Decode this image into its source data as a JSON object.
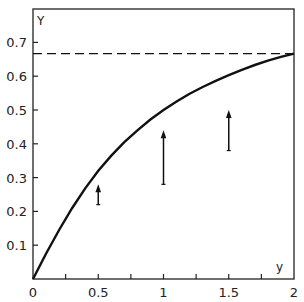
{
  "chart_data": {
    "type": "line",
    "title": "",
    "xlabel": "y",
    "ylabel": "Y",
    "xlim": [
      0,
      2
    ],
    "ylim": [
      0,
      0.78
    ],
    "x_ticks": [
      "0",
      "0.5",
      "1",
      "1.5",
      "2"
    ],
    "x_tick_values": [
      0,
      0.5,
      1,
      1.5,
      2
    ],
    "x_minor_ticks": [
      0.25,
      0.75,
      1.25,
      1.75
    ],
    "y_ticks": [
      "0.1",
      "0.2",
      "0.3",
      "0.4",
      "0.5",
      "0.6",
      "0.7"
    ],
    "y_tick_values": [
      0.1,
      0.2,
      0.3,
      0.4,
      0.5,
      0.6,
      0.7
    ],
    "grid": false,
    "series": [
      {
        "name": "curve",
        "style": "solid",
        "x": [
          0,
          0.1,
          0.2,
          0.3,
          0.4,
          0.5,
          0.6,
          0.7,
          0.8,
          0.9,
          1.0,
          1.1,
          1.2,
          1.3,
          1.4,
          1.5,
          1.6,
          1.7,
          1.8,
          1.9,
          2.0
        ],
        "y": [
          0,
          0.075,
          0.145,
          0.21,
          0.268,
          0.32,
          0.365,
          0.405,
          0.44,
          0.472,
          0.5,
          0.525,
          0.548,
          0.568,
          0.586,
          0.603,
          0.619,
          0.633,
          0.646,
          0.657,
          0.667
        ]
      },
      {
        "name": "asymptote",
        "style": "dashed",
        "x": [
          0,
          2
        ],
        "y": [
          0.667,
          0.667
        ]
      }
    ],
    "arrows": [
      {
        "x": 0.5,
        "y_from": 0.22,
        "y_to": 0.28
      },
      {
        "x": 1.0,
        "y_from": 0.28,
        "y_to": 0.44
      },
      {
        "x": 1.5,
        "y_from": 0.38,
        "y_to": 0.5
      }
    ]
  }
}
